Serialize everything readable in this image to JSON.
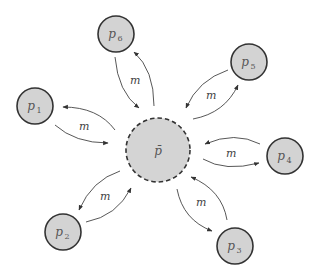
{
  "diagram": {
    "center": {
      "id": "pbar",
      "label": "p̄",
      "x": 158,
      "y": 150,
      "r": 32,
      "style": "dashed"
    },
    "nodes": [
      {
        "id": "p1",
        "base": "p",
        "sub": "1",
        "x": 35,
        "y": 106,
        "r": 18
      },
      {
        "id": "p2",
        "base": "p",
        "sub": "2",
        "x": 63,
        "y": 232,
        "r": 18
      },
      {
        "id": "p3",
        "base": "p",
        "sub": "3",
        "x": 235,
        "y": 246,
        "r": 18
      },
      {
        "id": "p4",
        "base": "p",
        "sub": "4",
        "x": 285,
        "y": 156,
        "r": 18
      },
      {
        "id": "p5",
        "base": "p",
        "sub": "5",
        "x": 249,
        "y": 62,
        "r": 18
      },
      {
        "id": "p6",
        "base": "p",
        "sub": "6",
        "x": 116,
        "y": 34,
        "r": 18
      }
    ],
    "edge_label": "m",
    "edges": [
      {
        "node": "p6",
        "label": "m"
      },
      {
        "node": "p5",
        "label": "m"
      },
      {
        "node": "p1",
        "label": "m"
      },
      {
        "node": "p4",
        "label": "m"
      },
      {
        "node": "p2",
        "label": "m"
      },
      {
        "node": "p3",
        "label": "m"
      }
    ],
    "colors": {
      "node_fill": "#d3d3d3",
      "stroke": "#333333",
      "edge": "#444444",
      "background": "#ffffff"
    }
  }
}
